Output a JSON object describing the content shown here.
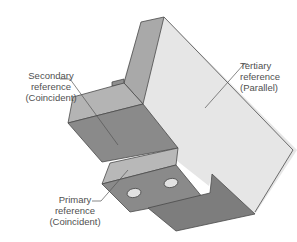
{
  "diagram": {
    "colors": {
      "background": "#ffffff",
      "face_light": "#e6e6e6",
      "face_medium": "#b8b8b8",
      "face_medium_side": "#a9a9a9",
      "face_dark": "#8a8a8a",
      "face_darker": "#7d7d7d",
      "hole": "#e2e2e2",
      "edge": "#4a4a4a",
      "leader": "#555555",
      "label_text": "#505050"
    },
    "labels": {
      "secondary": {
        "line1": "Secondary",
        "line2": "reference",
        "line3": "(Coincident)"
      },
      "tertiary": {
        "line1": "Tertiary",
        "line2": "reference",
        "line3": "(Parallel)"
      },
      "primary": {
        "line1": "Primary",
        "line2": "reference",
        "line3": "(Coincident)"
      }
    }
  }
}
